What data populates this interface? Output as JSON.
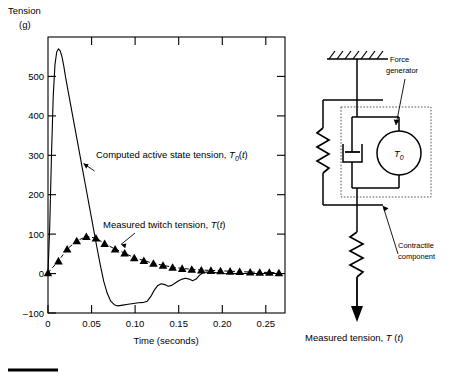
{
  "figure": {
    "bottom_rule": true
  },
  "chart_data": {
    "type": "line",
    "title": "",
    "ylabel_line1": "Tension",
    "ylabel_line2": "(g)",
    "xlabel": "Time (seconds)",
    "xlim": [
      0,
      0.272
    ],
    "ylim": [
      -100,
      600
    ],
    "xticks": [
      0,
      0.05,
      0.1,
      0.15,
      0.2,
      0.25
    ],
    "xticklabels": [
      "0",
      "0.05",
      "0.10",
      "0.15",
      "0.20",
      "0.25"
    ],
    "yticks": [
      -100,
      0,
      100,
      200,
      300,
      400,
      500
    ],
    "yticklabels": [
      "–100",
      "0",
      "100",
      "200",
      "300",
      "400",
      "500"
    ],
    "grid": false,
    "legend_position": "annotations-inline",
    "series": [
      {
        "name": "Computed active state tension, T0(t)",
        "marker": "none",
        "x": [
          0,
          0.002,
          0.004,
          0.006,
          0.008,
          0.01,
          0.012,
          0.014,
          0.016,
          0.018,
          0.02,
          0.024,
          0.028,
          0.032,
          0.036,
          0.04,
          0.044,
          0.048,
          0.052,
          0.056,
          0.06,
          0.064,
          0.068,
          0.072,
          0.076,
          0.08,
          0.086,
          0.092,
          0.098,
          0.104,
          0.11,
          0.114,
          0.118,
          0.122,
          0.126,
          0.13,
          0.134,
          0.138,
          0.142,
          0.146,
          0.15,
          0.154,
          0.158,
          0.162,
          0.166,
          0.17,
          0.174,
          0.178,
          0.182,
          0.188,
          0.194,
          0.2,
          0.21,
          0.22,
          0.235,
          0.25,
          0.265,
          0.272
        ],
        "y": [
          0,
          120,
          300,
          450,
          530,
          562,
          570,
          565,
          550,
          528,
          500,
          452,
          404,
          356,
          308,
          260,
          212,
          164,
          116,
          68,
          22,
          -20,
          -50,
          -70,
          -79,
          -82,
          -80,
          -78,
          -76,
          -74,
          -73,
          -70,
          -58,
          -42,
          -30,
          -26,
          -28,
          -32,
          -30,
          -24,
          -18,
          -14,
          -12,
          -14,
          -18,
          -14,
          -4,
          2,
          4,
          3,
          2,
          1,
          0,
          0,
          0,
          0,
          0,
          0
        ]
      },
      {
        "name": "Measured twitch tension, T(t)",
        "marker": "triangle",
        "x": [
          0,
          0.012,
          0.022,
          0.033,
          0.044,
          0.055,
          0.065,
          0.077,
          0.088,
          0.099,
          0.11,
          0.121,
          0.132,
          0.143,
          0.154,
          0.165,
          0.176,
          0.187,
          0.198,
          0.209,
          0.22,
          0.232,
          0.243,
          0.254,
          0.265
        ],
        "y": [
          2,
          32,
          62,
          83,
          94,
          90,
          76,
          62,
          52,
          40,
          33,
          26,
          21,
          16,
          13,
          11,
          9,
          8,
          7,
          6,
          5,
          4,
          3,
          3,
          2
        ]
      }
    ],
    "annotations": [
      {
        "name": "computed-active-state-tension",
        "text_plain": "Computed active state tension, ",
        "symbol": "T",
        "symbol_sub": "0",
        "symbol_tail": "(t)"
      },
      {
        "name": "measured-twitch-tension",
        "text_plain": "Measured twitch tension, ",
        "symbol": "T",
        "symbol_sub": "",
        "symbol_tail": "(t)"
      }
    ]
  },
  "diagram": {
    "force_generator_label_line1": "Force",
    "force_generator_label_line2": "generator",
    "generator_symbol": "T",
    "generator_symbol_sub": "0",
    "contractile_label_line1": "Contractile",
    "contractile_label_line2": "component",
    "measured_tension_text": "Measured tension, ",
    "measured_tension_symbol": "T",
    "measured_tension_tail": "(t)"
  }
}
